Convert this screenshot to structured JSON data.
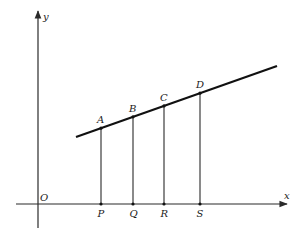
{
  "diagram": {
    "axes": {
      "x_label": "x",
      "y_label": "y",
      "origin_label": "O"
    },
    "line_points": [
      {
        "label": "A",
        "foot_label": "P"
      },
      {
        "label": "B",
        "foot_label": "Q"
      },
      {
        "label": "C",
        "foot_label": "R"
      },
      {
        "label": "D",
        "foot_label": "S"
      }
    ],
    "colors": {
      "stroke": "#111111",
      "background": "#ffffff"
    }
  }
}
